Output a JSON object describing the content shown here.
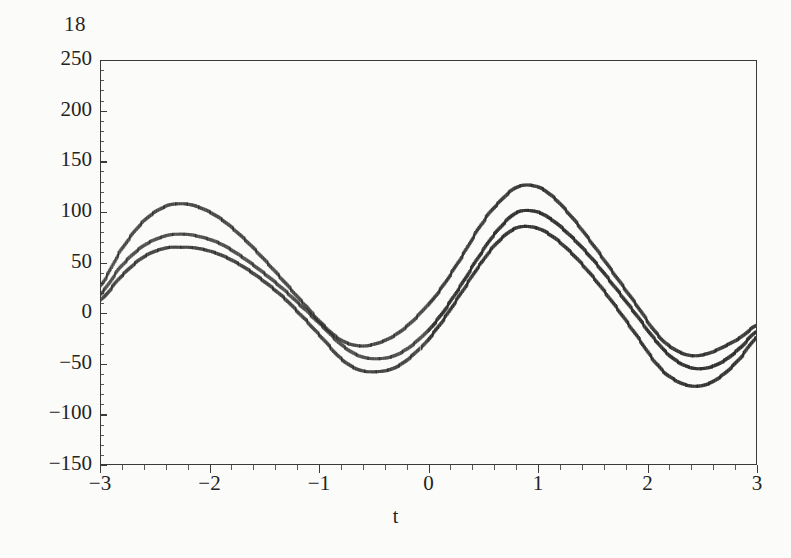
{
  "figure": {
    "number": "18"
  },
  "chart_data": {
    "type": "line",
    "title": "",
    "xlabel": "t",
    "ylabel": "",
    "xlim": [
      -3,
      3
    ],
    "ylim": [
      -150,
      250
    ],
    "grid": false,
    "legend": null,
    "style": "dashed-tick-marks",
    "x_ticks": [
      -3,
      -2,
      -1,
      0,
      1,
      2,
      3
    ],
    "x_tick_labels": [
      "−3",
      "−2",
      "−1",
      "0",
      "1",
      "2",
      "3"
    ],
    "x_minor_tick_step": 0.2,
    "y_ticks": [
      -150,
      -100,
      -50,
      0,
      50,
      100,
      150,
      200,
      250
    ],
    "y_tick_labels": [
      "−150",
      "−100",
      "−50",
      "0",
      "50",
      "100",
      "150",
      "200",
      "250"
    ],
    "y_minor_tick_step": 10,
    "series": [
      {
        "name": "upper",
        "x": [
          -3.0,
          -2.8,
          -2.6,
          -2.4,
          -2.25,
          -2.1,
          -1.9,
          -1.7,
          -1.5,
          -1.3,
          -1.1,
          -0.95,
          -0.8,
          -0.65,
          -0.5,
          -0.3,
          -0.1,
          0.1,
          0.3,
          0.5,
          0.65,
          0.8,
          0.95,
          1.1,
          1.3,
          1.5,
          1.7,
          1.9,
          2.1,
          2.25,
          2.4,
          2.55,
          2.7,
          2.85,
          3.0
        ],
        "y": [
          26,
          62,
          90,
          105,
          108,
          105,
          94,
          76,
          54,
          30,
          6,
          -12,
          -26,
          -32,
          -31,
          -22,
          -4,
          22,
          55,
          90,
          110,
          124,
          126,
          118,
          96,
          68,
          38,
          8,
          -22,
          -36,
          -42,
          -40,
          -33,
          -24,
          -12
        ]
      },
      {
        "name": "middle",
        "x": [
          -3.0,
          -2.8,
          -2.6,
          -2.4,
          -2.25,
          -2.1,
          -1.9,
          -1.7,
          -1.5,
          -1.3,
          -1.1,
          -0.95,
          -0.8,
          -0.65,
          -0.5,
          -0.3,
          -0.1,
          0.1,
          0.3,
          0.5,
          0.65,
          0.8,
          0.95,
          1.1,
          1.3,
          1.5,
          1.7,
          1.9,
          2.1,
          2.25,
          2.4,
          2.55,
          2.7,
          2.85,
          3.0
        ],
        "y": [
          18,
          46,
          66,
          76,
          78,
          76,
          69,
          56,
          40,
          22,
          2,
          -14,
          -30,
          -41,
          -45,
          -42,
          -28,
          -4,
          28,
          62,
          84,
          99,
          101,
          94,
          76,
          53,
          26,
          -2,
          -30,
          -46,
          -54,
          -54,
          -47,
          -34,
          -18
        ]
      },
      {
        "name": "lower",
        "x": [
          -3.0,
          -2.8,
          -2.6,
          -2.4,
          -2.25,
          -2.1,
          -1.9,
          -1.7,
          -1.5,
          -1.3,
          -1.1,
          -0.95,
          -0.8,
          -0.65,
          -0.5,
          -0.3,
          -0.1,
          0.1,
          0.3,
          0.5,
          0.65,
          0.8,
          0.95,
          1.1,
          1.3,
          1.5,
          1.7,
          1.9,
          2.1,
          2.25,
          2.4,
          2.55,
          2.7,
          2.85,
          3.0
        ],
        "y": [
          12,
          36,
          55,
          64,
          65,
          64,
          58,
          47,
          32,
          14,
          -8,
          -26,
          -44,
          -55,
          -58,
          -54,
          -38,
          -12,
          20,
          52,
          72,
          84,
          85,
          78,
          60,
          36,
          8,
          -22,
          -52,
          -66,
          -72,
          -70,
          -60,
          -44,
          -24
        ]
      }
    ]
  },
  "colors": {
    "ink": "#2b2b2b",
    "axis": "#3a3a3a",
    "paper": "#fbfbf9"
  }
}
